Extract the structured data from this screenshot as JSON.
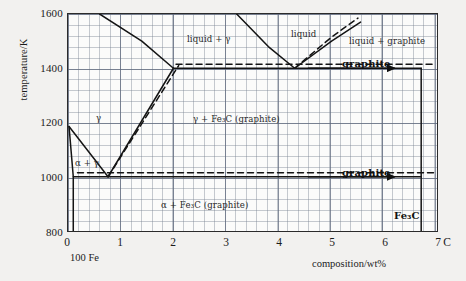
{
  "figure": {
    "ylabel": "temperature/K",
    "xlabel": "composition/wt%",
    "origin_note": "100 Fe",
    "carbon_designation": "C"
  },
  "axes": {
    "yticks": [
      "1600",
      "1400",
      "1200",
      "1000",
      "800"
    ],
    "yvalues": [
      1600,
      1400,
      1200,
      1000,
      800
    ],
    "xticks": [
      "0",
      "1",
      "2",
      "3",
      "4",
      "5",
      "6",
      "7"
    ],
    "xvalues": [
      0,
      1,
      2,
      3,
      4,
      5,
      6,
      7
    ],
    "ylim": [
      800,
      1600
    ],
    "xlim": [
      0,
      7
    ],
    "grid": "graph-paper"
  },
  "regions": [
    {
      "id": "gamma",
      "text": "γ",
      "x": 95,
      "y": 112
    },
    {
      "id": "alpha-gamma",
      "text": "α + γ",
      "x": 74,
      "y": 157
    },
    {
      "id": "liquid-gamma",
      "text": "liquid + γ",
      "x": 186,
      "y": 33
    },
    {
      "id": "liquid",
      "text": "liquid",
      "x": 290,
      "y": 28
    },
    {
      "id": "liquid-graphite",
      "text": "liquid + graphite",
      "x": 348,
      "y": 35
    },
    {
      "id": "gamma-fe3c",
      "text": "γ + Fe₃C (graphite)",
      "x": 192,
      "y": 113
    },
    {
      "id": "alpha-fe3c",
      "text": "α + Fe₃C (graphite)",
      "x": 160,
      "y": 199
    },
    {
      "id": "graphite-upper",
      "text": "graphite",
      "x": 341,
      "y": 57,
      "style": "big"
    },
    {
      "id": "graphite-lower",
      "text": "graphite",
      "x": 341,
      "y": 166,
      "style": "big"
    },
    {
      "id": "fe3c",
      "text": "Fe₃C",
      "x": 393,
      "y": 209,
      "style": "big"
    }
  ],
  "chart_data": {
    "type": "line",
    "title": "",
    "xlabel": "composition/wt%",
    "ylabel": "temperature/K",
    "xlim": [
      0,
      7
    ],
    "ylim": [
      800,
      1600
    ],
    "grid": true,
    "legend": "none",
    "colors": {
      "curve": "#1a1a1a",
      "metastable": "#1a1a1a",
      "grid": "#7a8495",
      "background": "#f2f1ef"
    },
    "annotations": [
      {
        "label": "eutectoid point",
        "x": 0.76,
        "y": 1000
      },
      {
        "label": "eutectic point",
        "x": 4.3,
        "y": 1400
      },
      {
        "label": "max gamma solubility",
        "x": 2.0,
        "y": 1400
      },
      {
        "label": "Fe3C stoichiometric line",
        "x": 6.7,
        "y": null
      }
    ],
    "series": [
      {
        "name": "alpha/(alpha+gamma) solvus (A3 lower, Fe-rich)",
        "style": "solid",
        "points": [
          [
            0.02,
            1185
          ],
          [
            0.1,
            1000
          ],
          [
            0.1,
            800
          ]
        ]
      },
      {
        "name": "gamma solvus (A3 boundary) to eutectoid",
        "style": "solid",
        "points": [
          [
            0.02,
            1185
          ],
          [
            0.76,
            1000
          ]
        ]
      },
      {
        "name": "Acm: gamma / gamma+Fe3C boundary (stable graphite)",
        "style": "solid",
        "points": [
          [
            0.76,
            1000
          ],
          [
            2.0,
            1400
          ]
        ]
      },
      {
        "name": "Acm metastable (Fe3C) dashed",
        "style": "dashed",
        "points": [
          [
            0.76,
            1000
          ],
          [
            2.1,
            1410
          ]
        ]
      },
      {
        "name": "gamma liquidus (liquid / liquid+gamma)",
        "style": "solid",
        "points": [
          [
            0.6,
            1600
          ],
          [
            1.4,
            1500
          ],
          [
            2.0,
            1400
          ]
        ]
      },
      {
        "name": "liquidus left of eutectic",
        "style": "solid",
        "points": [
          [
            3.2,
            1600
          ],
          [
            3.8,
            1480
          ],
          [
            4.3,
            1400
          ]
        ]
      },
      {
        "name": "liquidus right of eutectic (graphite)",
        "style": "solid",
        "points": [
          [
            4.3,
            1400
          ],
          [
            5.0,
            1500
          ],
          [
            5.55,
            1570
          ]
        ]
      },
      {
        "name": "liquidus right of eutectic metastable (dashed)",
        "style": "dashed",
        "points": [
          [
            4.3,
            1400
          ],
          [
            5.0,
            1515
          ],
          [
            5.5,
            1585
          ]
        ]
      },
      {
        "name": "eutectic horizontal (stable, 1400 K)",
        "style": "solid",
        "points": [
          [
            2.0,
            1400
          ],
          [
            6.7,
            1400
          ]
        ]
      },
      {
        "name": "eutectic horizontal metastable (dashed)",
        "style": "dashed",
        "points": [
          [
            2.05,
            1415
          ],
          [
            6.95,
            1415
          ]
        ]
      },
      {
        "name": "eutectoid horizontal (stable, 1000 K)",
        "style": "solid",
        "points": [
          [
            0.1,
            1000
          ],
          [
            6.7,
            1000
          ]
        ]
      },
      {
        "name": "eutectoid horizontal metastable (dashed)",
        "style": "dashed",
        "points": [
          [
            0.18,
            1015
          ],
          [
            6.95,
            1015
          ]
        ]
      },
      {
        "name": "Fe3C vertical line at 6.7 wt%",
        "style": "solid",
        "points": [
          [
            6.7,
            1400
          ],
          [
            6.7,
            800
          ]
        ]
      }
    ],
    "arrows": [
      {
        "name": "graphite-arrow-upper",
        "from": [
          4.55,
          1400
        ],
        "to": [
          6.2,
          1400
        ]
      },
      {
        "name": "graphite-arrow-lower",
        "from": [
          4.55,
          1000
        ],
        "to": [
          6.2,
          1000
        ]
      }
    ]
  }
}
